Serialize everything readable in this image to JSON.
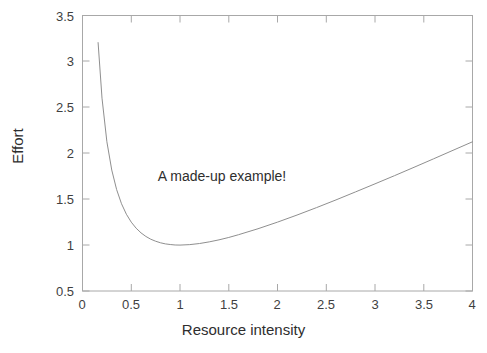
{
  "figure": {
    "background_color": "#ffffff",
    "axes_color": "#9a9a9a",
    "line_color": "#8c8c8c",
    "text_color": "#3a3a3a"
  },
  "chart_data": {
    "type": "line",
    "title": "",
    "xlabel": "Resource intensity",
    "ylabel": "Effort",
    "xlim": [
      0,
      4
    ],
    "ylim": [
      0.5,
      3.5
    ],
    "xticks": [
      0,
      0.5,
      1,
      1.5,
      2,
      2.5,
      3,
      3.5,
      4
    ],
    "xtick_labels": [
      "0",
      "0.5",
      "1",
      "1.5",
      "2",
      "2.5",
      "3",
      "3.5",
      "4"
    ],
    "yticks": [
      0.5,
      1,
      1.5,
      2,
      2.5,
      3,
      3.5
    ],
    "ytick_labels": [
      "0.5",
      "1",
      "1.5",
      "2",
      "2.5",
      "3",
      "3.5"
    ],
    "grid": false,
    "legend": null,
    "annotations": [
      {
        "text": "A made-up example!",
        "x": 1.43,
        "y": 1.74
      }
    ],
    "series": [
      {
        "name": "effort",
        "formula": "y = 0.5/x + 0.5*x",
        "x": [
          0.16,
          0.2,
          0.25,
          0.3,
          0.35,
          0.4,
          0.45,
          0.5,
          0.55,
          0.6,
          0.65,
          0.7,
          0.75,
          0.8,
          0.85,
          0.9,
          0.95,
          1.0,
          1.1,
          1.2,
          1.3,
          1.4,
          1.5,
          1.6,
          1.8,
          2.0,
          2.2,
          2.4,
          2.6,
          2.8,
          3.0,
          3.2,
          3.4,
          3.6,
          3.8,
          4.0
        ],
        "y": [
          3.205,
          2.6,
          2.125,
          1.817,
          1.604,
          1.45,
          1.336,
          1.25,
          1.184,
          1.133,
          1.094,
          1.064,
          1.042,
          1.025,
          1.013,
          1.006,
          1.001,
          1.0,
          1.005,
          1.017,
          1.035,
          1.057,
          1.083,
          1.113,
          1.178,
          1.25,
          1.327,
          1.408,
          1.492,
          1.579,
          1.667,
          1.756,
          1.847,
          1.939,
          2.032,
          2.125
        ]
      }
    ]
  }
}
